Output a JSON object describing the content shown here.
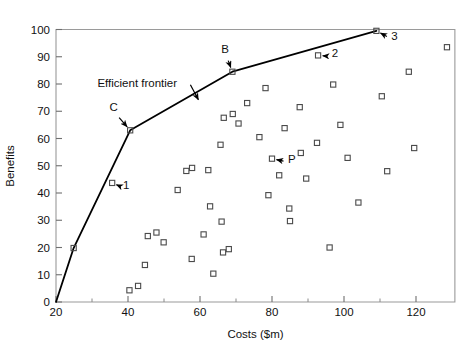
{
  "chart_data": {
    "type": "scatter",
    "title": "",
    "xlabel": "Costs ($m)",
    "ylabel": "Benefits",
    "xlim": [
      20,
      130.8
    ],
    "ylim": [
      0,
      100
    ],
    "xticks": [
      20,
      40,
      60,
      80,
      100,
      120
    ],
    "yticks": [
      0,
      10,
      20,
      30,
      40,
      50,
      60,
      70,
      80,
      90,
      100
    ],
    "xtick_labels": [
      "20",
      "40",
      "60",
      "80",
      "100",
      "120"
    ],
    "ytick_labels": [
      "0",
      "10",
      "20",
      "30",
      "40",
      "50",
      "60",
      "70",
      "80",
      "90",
      "100"
    ],
    "xminorticks": [
      30,
      50,
      70,
      90,
      110
    ],
    "grid": false,
    "legend": null,
    "marker": "open-square",
    "series": [
      {
        "name": "Projects",
        "points": [
          [
            24.9,
            19.8
          ],
          [
            35.6,
            43.7
          ],
          [
            40.6,
            63.0
          ],
          [
            40.4,
            4.3
          ],
          [
            42.8,
            5.9
          ],
          [
            44.7,
            13.6
          ],
          [
            45.5,
            24.2
          ],
          [
            47.9,
            25.5
          ],
          [
            49.9,
            21.9
          ],
          [
            53.8,
            41.1
          ],
          [
            56.2,
            48.1
          ],
          [
            57.8,
            49.2
          ],
          [
            57.7,
            15.8
          ],
          [
            62.8,
            35.1
          ],
          [
            63.7,
            10.4
          ],
          [
            66.4,
            18.2
          ],
          [
            68.0,
            19.4
          ],
          [
            69.0,
            84.5
          ],
          [
            66.6,
            67.6
          ],
          [
            69.1,
            69.0
          ],
          [
            70.7,
            65.5
          ],
          [
            66.0,
            29.5
          ],
          [
            65.7,
            57.7
          ],
          [
            62.3,
            48.4
          ],
          [
            61.0,
            24.8
          ],
          [
            73.1,
            73.0
          ],
          [
            76.5,
            60.5
          ],
          [
            78.2,
            78.5
          ],
          [
            79.0,
            39.2
          ],
          [
            80.0,
            52.6
          ],
          [
            82.0,
            46.5
          ],
          [
            83.5,
            63.8
          ],
          [
            84.8,
            34.3
          ],
          [
            85.0,
            29.7
          ],
          [
            87.7,
            71.5
          ],
          [
            88.0,
            54.7
          ],
          [
            89.5,
            45.3
          ],
          [
            92.8,
            90.5
          ],
          [
            92.5,
            58.4
          ],
          [
            96.0,
            20.0
          ],
          [
            97.0,
            79.8
          ],
          [
            99.0,
            65.0
          ],
          [
            101.0,
            52.9
          ],
          [
            104.0,
            36.5
          ],
          [
            109.0,
            99.5
          ],
          [
            110.5,
            75.5
          ],
          [
            112.0,
            48.0
          ],
          [
            118.0,
            84.5
          ],
          [
            119.5,
            56.5
          ],
          [
            128.6,
            93.5
          ]
        ]
      }
    ],
    "frontier": {
      "label": "Efficient frontier",
      "points": [
        [
          20.0,
          0.0
        ],
        [
          24.9,
          19.8
        ],
        [
          40.6,
          63.0
        ],
        [
          69.0,
          84.5
        ],
        [
          109.0,
          99.5
        ]
      ]
    },
    "annotations": [
      {
        "text": "Efficient frontier",
        "x": 31.5,
        "y": 79.0,
        "kind": "label"
      },
      {
        "text": "C",
        "x": 36.0,
        "y": 70.0,
        "kind": "point-label",
        "target": [
          40.6,
          63.0
        ]
      },
      {
        "text": "B",
        "x": 67.0,
        "y": 91.5,
        "kind": "point-label",
        "target": [
          69.0,
          84.5
        ]
      },
      {
        "text": "1",
        "x": 39.5,
        "y": 41.5,
        "kind": "point-label",
        "target": [
          35.6,
          43.7
        ]
      },
      {
        "text": "2",
        "x": 97.5,
        "y": 90.0,
        "kind": "point-label",
        "target": [
          92.8,
          90.5
        ]
      },
      {
        "text": "3",
        "x": 114.0,
        "y": 96.0,
        "kind": "point-label",
        "target": [
          109.0,
          99.5
        ]
      },
      {
        "text": "P",
        "x": 85.5,
        "y": 51.0,
        "kind": "point-label",
        "target": [
          80.0,
          52.6
        ]
      }
    ]
  }
}
